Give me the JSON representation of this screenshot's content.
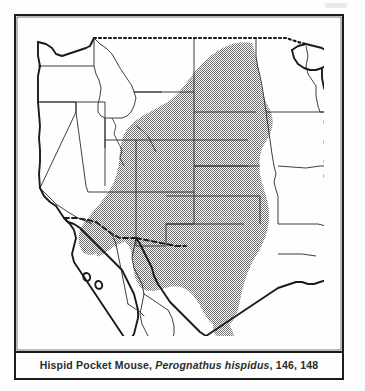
{
  "figure": {
    "kind": "species-distribution-map",
    "region": "western and central United States, northern Mexico",
    "caption": {
      "common_name": "Hispid Pocket Mouse,",
      "scientific_name": "Perognathus hispidus",
      "separator": ",",
      "page_references": "146, 148",
      "full_text": "Hispid Pocket Mouse, Perognathus hispidus, 146, 148"
    },
    "colors": {
      "ink": "#1b1b1b",
      "paper": "#fefefe",
      "range_shading": "#8a8a8a",
      "state_line": "#2a2a2a",
      "coast_line": "#1b1b1b"
    },
    "legend": {
      "shaded_meaning": "species range"
    },
    "map_features": {
      "outline_style": "solid black coastline and international border",
      "state_borders": "thin black lines",
      "range_fill": "stippled gray halftone",
      "dashed_border": "United States - Mexico / United States - Canada boundary shown dotted"
    }
  }
}
